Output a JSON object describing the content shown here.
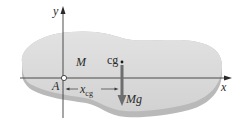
{
  "diagram": {
    "type": "rigid-body free body diagram",
    "axes": {
      "x_label": "x",
      "y_label": "y"
    },
    "points": {
      "pivot": {
        "label": "A"
      },
      "center_of_gravity": {
        "label": "cg"
      }
    },
    "body": {
      "mass_label": "M"
    },
    "force": {
      "label": "Mg",
      "direction": "down"
    },
    "dimension": {
      "label_main": "x",
      "label_sub": "cg"
    },
    "colors": {
      "body_top": "#d9d9d9",
      "body_edge": "#b5b5b5",
      "axis": "#3a3a3a",
      "force_arrow": "#6e6e6e"
    }
  }
}
